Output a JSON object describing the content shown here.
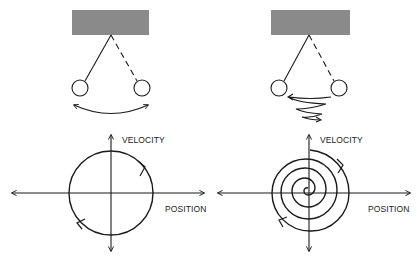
{
  "panels": [
    {
      "id": "undamped",
      "description": "Frictionless pendulum swinging with constant amplitude",
      "pendulum": {
        "support_color": "#8a8a8a",
        "motion": "constant-amplitude-swing"
      },
      "phase_plot": {
        "y_axis_label": "VELOCITY",
        "x_axis_label": "POSITION",
        "trajectory": "circle",
        "direction": "clockwise"
      }
    },
    {
      "id": "damped",
      "description": "Damped pendulum with decaying amplitude",
      "pendulum": {
        "support_color": "#8a8a8a",
        "motion": "decaying-swing"
      },
      "phase_plot": {
        "y_axis_label": "VELOCITY",
        "x_axis_label": "POSITION",
        "trajectory": "inward spiral",
        "direction": "clockwise"
      }
    }
  ],
  "colors": {
    "line": "#1a1a1a",
    "support": "#8a8a8a",
    "background": "#ffffff"
  }
}
